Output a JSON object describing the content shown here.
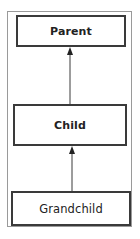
{
  "diagram": {
    "type": "hierarchy",
    "nodes": [
      {
        "id": "parent",
        "label": "Parent"
      },
      {
        "id": "child",
        "label": "Child"
      },
      {
        "id": "grandchild",
        "label": "Grandchild"
      }
    ],
    "edges": [
      {
        "from": "child",
        "to": "parent"
      },
      {
        "from": "grandchild",
        "to": "child"
      }
    ],
    "colors": {
      "border": "#3a3a3a",
      "frame": "#9a9a9a",
      "background": "#ffffff"
    }
  }
}
